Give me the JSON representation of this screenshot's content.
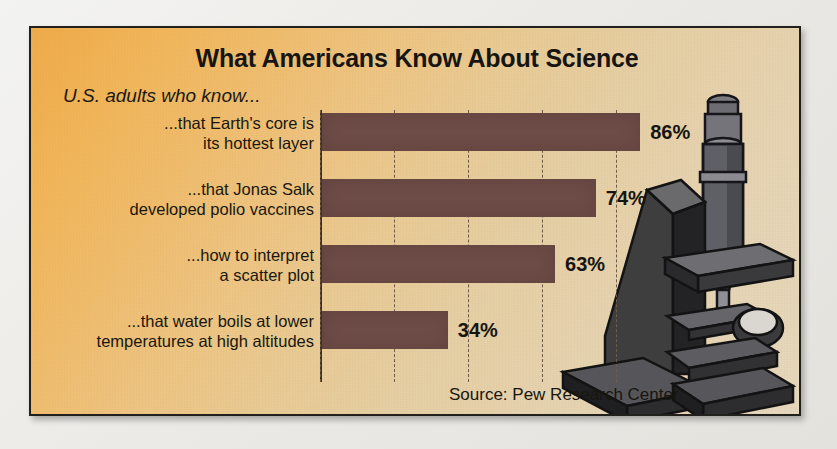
{
  "panel": {
    "title": "What Americans Know About Science",
    "subtitle": "U.S. adults who know...",
    "source": "Source: Pew Research Center",
    "illustration": "microscope-illustration"
  },
  "colors": {
    "bar": "#6d4b46",
    "background_top_left": "#f0ac4a",
    "background_bottom_right": "#e7d8bd",
    "border": "#22201c",
    "text": "#17150f",
    "gridline": "#6e5c46",
    "microscope_dark": "#3a3a39",
    "microscope_mid": "#55555a",
    "microscope_light": "#8d8d92"
  },
  "chart_data": {
    "type": "bar",
    "orientation": "horizontal",
    "title": "What Americans Know About Science",
    "subtitle": "U.S. adults who know...",
    "xlabel": "",
    "ylabel": "",
    "xlim": [
      0,
      100
    ],
    "xticks": [
      0,
      20,
      40,
      60,
      80
    ],
    "grid": "vertical-dashed",
    "legend": "none",
    "unit": "%",
    "source": "Source: Pew Research Center",
    "categories": [
      "...that Earth's core is its hottest layer",
      "...that Jonas Salk developed polio vaccines",
      "...how to interpret a scatter plot",
      "...that water boils at lower temperatures at high altitudes"
    ],
    "values": [
      86,
      74,
      63,
      34
    ],
    "bars": [
      {
        "label_line1": "...that Earth's core is",
        "label_line2": "its hottest layer",
        "value": 86,
        "value_label": "86%"
      },
      {
        "label_line1": "...that Jonas Salk",
        "label_line2": "developed polio vaccines",
        "value": 74,
        "value_label": "74%"
      },
      {
        "label_line1": "...how to interpret",
        "label_line2": "a scatter plot",
        "value": 63,
        "value_label": "63%"
      },
      {
        "label_line1": "...that water boils at lower",
        "label_line2": "temperatures at high altitudes",
        "value": 34,
        "value_label": "34%"
      }
    ]
  }
}
